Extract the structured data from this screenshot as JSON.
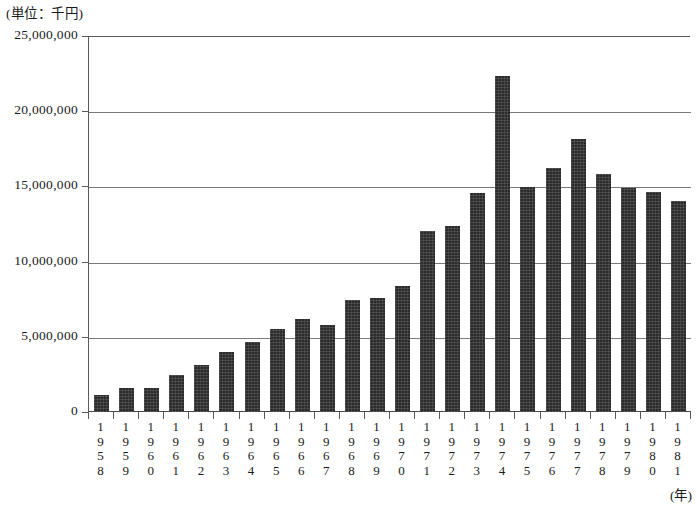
{
  "figure": {
    "unit_caption": "(単位：千円)",
    "x_axis_title": "(年)",
    "source_note": ""
  },
  "chart_data": {
    "type": "bar",
    "title": "",
    "subtitle": "",
    "xlabel": "(年)",
    "ylabel": "(単位：千円)",
    "ylim": [
      0,
      25000000
    ],
    "ytick_labels": [
      "25,000,000",
      "20,000,000",
      "15,000,000",
      "10,000,000",
      "5,000,000",
      "0"
    ],
    "ytick_values": [
      25000000,
      20000000,
      15000000,
      10000000,
      5000000,
      0
    ],
    "grid": true,
    "legend": "none",
    "bar_color": "#2b2b2b",
    "categories": [
      "1958",
      "1959",
      "1960",
      "1961",
      "1962",
      "1963",
      "1964",
      "1965",
      "1966",
      "1967",
      "1968",
      "1969",
      "1970",
      "1971",
      "1972",
      "1973",
      "1974",
      "1975",
      "1976",
      "1977",
      "1978",
      "1979",
      "1980",
      "1981"
    ],
    "values": [
      1100000,
      1600000,
      1600000,
      2450000,
      3150000,
      4000000,
      4650000,
      5500000,
      6200000,
      5800000,
      7450000,
      7600000,
      8400000,
      12050000,
      12400000,
      14550000,
      22350000,
      14950000,
      16250000,
      18150000,
      15800000,
      14900000,
      14600000,
      14000000
    ]
  }
}
